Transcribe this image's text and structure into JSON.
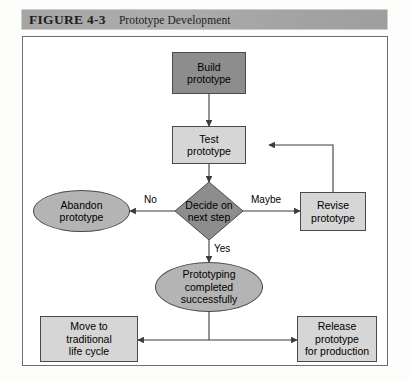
{
  "figure": {
    "number": "FIGURE 4-3",
    "caption": "Prototype Development"
  },
  "diagram": {
    "title": "Prototype Development",
    "type": "flowchart",
    "nodes": [
      {
        "id": "build",
        "label": "Build\nprototype",
        "shape": "rectangle",
        "fill": "#8d8d8d"
      },
      {
        "id": "test",
        "label": "Test\nprototype",
        "shape": "rectangle",
        "fill": "#d6d6d6"
      },
      {
        "id": "decide",
        "label": "Decide on\nnext step",
        "shape": "diamond",
        "fill": "#8d8d8d"
      },
      {
        "id": "abandon",
        "label": "Abandon\nprototype",
        "shape": "ellipse",
        "fill": "#b4b4b4"
      },
      {
        "id": "revise",
        "label": "Revise\nprototype",
        "shape": "rectangle",
        "fill": "#d6d6d6"
      },
      {
        "id": "complete",
        "label": "Prototyping\ncompleted\nsuccessfully",
        "shape": "ellipse",
        "fill": "#b4b4b4"
      },
      {
        "id": "move",
        "label": "Move to\ntraditional\nlife cycle",
        "shape": "rectangle",
        "fill": "#d6d6d6"
      },
      {
        "id": "release",
        "label": "Release\nprototype\nfor production",
        "shape": "rectangle",
        "fill": "#d6d6d6"
      }
    ],
    "edges": [
      {
        "from": "build",
        "to": "test",
        "label": ""
      },
      {
        "from": "test",
        "to": "decide",
        "label": ""
      },
      {
        "from": "decide",
        "to": "abandon",
        "label": "No"
      },
      {
        "from": "decide",
        "to": "revise",
        "label": "Maybe"
      },
      {
        "from": "decide",
        "to": "complete",
        "label": "Yes"
      },
      {
        "from": "revise",
        "to": "test",
        "label": ""
      },
      {
        "from": "complete",
        "to": "move",
        "label": ""
      },
      {
        "from": "complete",
        "to": "release",
        "label": ""
      }
    ],
    "edge_labels": {
      "no": "No",
      "maybe": "Maybe",
      "yes": "Yes"
    }
  },
  "colors": {
    "banner": "#a8a8a8",
    "node_dark": "#8d8d8d",
    "node_light": "#d6d6d6",
    "node_ellipse": "#b4b4b4",
    "stroke": "#4a4a4a",
    "frame": "#6f6f6f"
  }
}
